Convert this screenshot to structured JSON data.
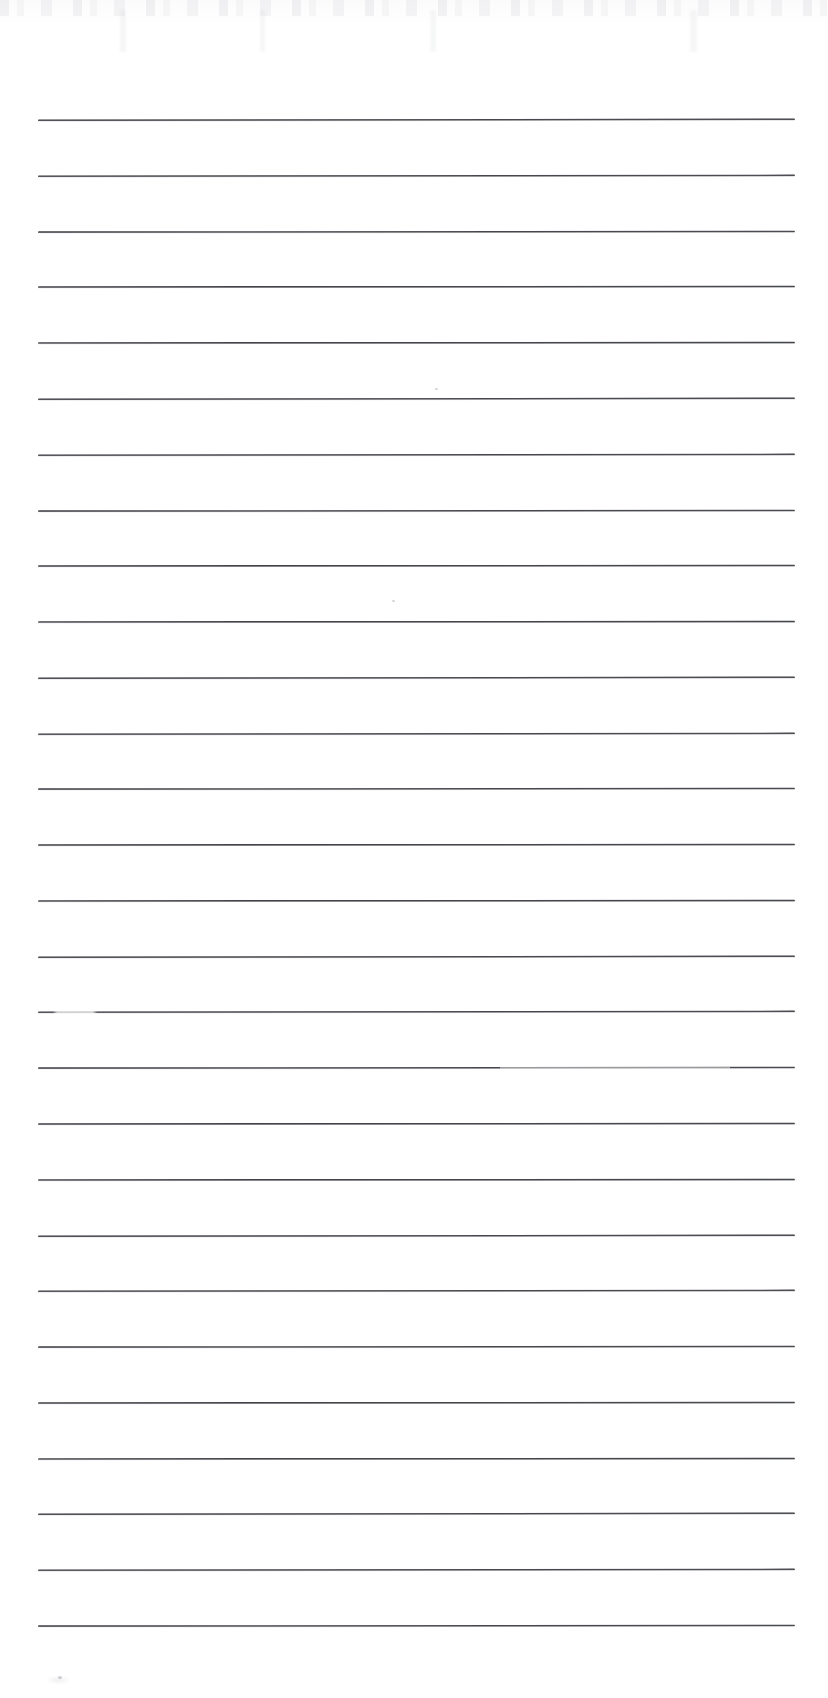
{
  "document": {
    "kind": "scanned-ruled-paper",
    "title": "Blank lined notebook page (scan)",
    "page_width": 828,
    "page_height": 1698,
    "background_color": "#ffffff",
    "rule_color": "#2c2e34",
    "content_text": "",
    "has_handwriting": false,
    "has_printed_text": false
  },
  "ruling": {
    "line_count": 28,
    "left_margin": 38,
    "right_margin": 795,
    "line_width": 757,
    "first_line_y": 119,
    "line_spacing": 55.7,
    "line_thickness": 2,
    "top_blank_margin_px": 119,
    "bottom_blank_margin_px": 76,
    "lines_y": [
      119,
      175,
      231,
      286,
      342,
      398,
      454,
      510,
      565,
      621,
      677,
      733,
      788,
      844,
      900,
      956,
      1011,
      1067,
      1123,
      1179,
      1235,
      1290,
      1346,
      1402,
      1458,
      1513,
      1569,
      1625
    ]
  },
  "artifacts": {
    "items": [
      {
        "name": "top-edge-scan-noise",
        "y": 0,
        "height": 16,
        "description": "faint gray speckle band along the top edge"
      },
      {
        "name": "faded-line-gap",
        "line_index": 16,
        "x": 55,
        "width": 40,
        "description": "ink dropout near the left end of one rule"
      },
      {
        "name": "soft-right-span",
        "line_index": 17,
        "x": 500,
        "width": 230,
        "description": "lightened right portion of one rule"
      },
      {
        "name": "speck-upper",
        "x": 435,
        "y": 388,
        "size": 3
      },
      {
        "name": "speck-mid",
        "x": 392,
        "y": 600,
        "size": 3
      },
      {
        "name": "speck-lower-left",
        "x": 58,
        "y": 1676,
        "size": 4
      }
    ]
  }
}
